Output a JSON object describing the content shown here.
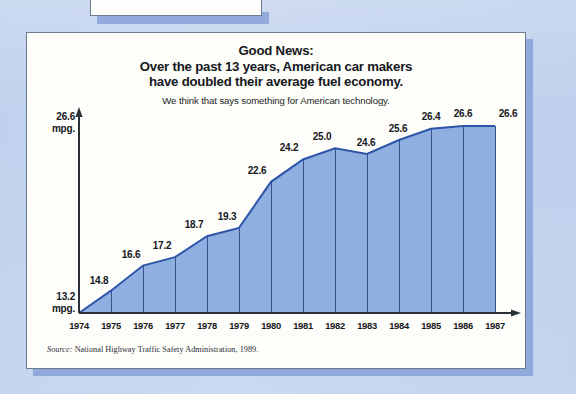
{
  "poster": {
    "headline_lines": [
      "Good News:",
      "Over the past 13 years, American car makers",
      "have doubled their average fuel economy."
    ],
    "subhead": "We think that says something for American technology.",
    "source_prefix": "Source:",
    "source_text": "National Highway Traffic Safety Administration, 1989."
  },
  "axis": {
    "top_value": "26.6",
    "top_unit": "mpg.",
    "bottom_value": "13.2",
    "bottom_unit": "mpg."
  },
  "colors": {
    "page_background": "#c3d3ee",
    "card_background": "#fdfdfa",
    "card_border": "#6c7a93",
    "shadow": "#8fa9da",
    "area_fill": "#8fafe0",
    "area_line": "#2d55a8",
    "grid_line": "#39508b",
    "axis_line": "#2a3038",
    "text": "#15181c"
  },
  "chart_data": {
    "type": "area",
    "title": "Over the past 13 years, American car makers have doubled their average fuel economy.",
    "subtitle": "We think that says something for American technology.",
    "xlabel": "",
    "ylabel": "mpg.",
    "ylim": [
      13.2,
      26.6
    ],
    "grid": "vertical",
    "legend": "none",
    "annotation": "Source: National Highway Traffic Safety Administration, 1989.",
    "categories": [
      "1974",
      "1975",
      "1976",
      "1977",
      "1978",
      "1979",
      "1980",
      "1981",
      "1982",
      "1983",
      "1984",
      "1985",
      "1986",
      "1987"
    ],
    "values": [
      13.2,
      14.8,
      16.6,
      17.2,
      18.7,
      19.3,
      22.6,
      24.2,
      25.0,
      24.6,
      25.6,
      26.4,
      26.6,
      26.6
    ],
    "point_labels": [
      "",
      "14.8",
      "16.6",
      "17.2",
      "18.7",
      "19.3",
      "22.6",
      "24.2",
      "25.0",
      "24.6",
      "25.6",
      "26.4",
      "26.6",
      "26.6"
    ]
  }
}
